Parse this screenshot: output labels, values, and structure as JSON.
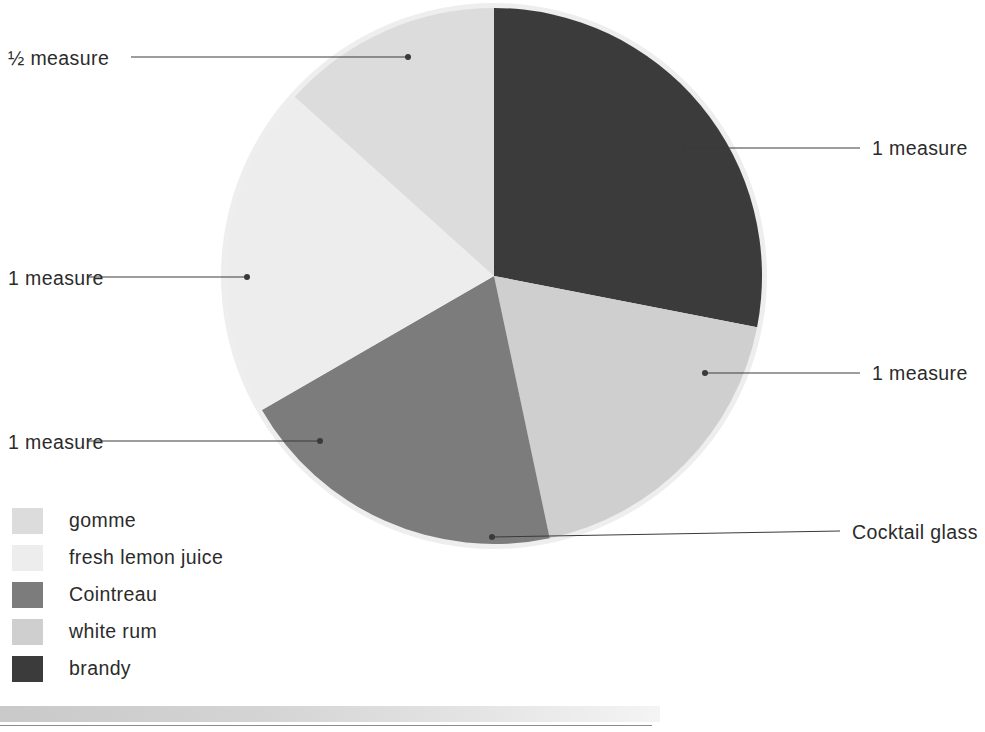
{
  "chart_data": {
    "type": "pie",
    "title": "",
    "units": "measure",
    "total_measures": 4.5,
    "legend_position": "bottom-left",
    "start_angle_deg": 0,
    "direction": "clockwise",
    "center": {
      "x": 494,
      "y": 276
    },
    "radius": 268,
    "categories": [
      "brandy",
      "white rum",
      "Cointreau",
      "fresh lemon juice",
      "gomme"
    ],
    "values": [
      1,
      1,
      1,
      1,
      0.5
    ],
    "value_labels": [
      "1 measure",
      "1 measure",
      "1 measure",
      "1 measure",
      "½ measure"
    ],
    "percentages": [
      28.1,
      18.6,
      20.0,
      20.0,
      13.3
    ],
    "colors": [
      "#3b3b3b",
      "#cfcfcf",
      "#7c7c7c",
      "#ededed",
      "#dcdcdc"
    ],
    "slices": [
      {
        "name": "brandy",
        "label": "1 measure",
        "value": 1,
        "start_deg": 0,
        "end_deg": 101,
        "color": "#3b3b3b"
      },
      {
        "name": "white rum",
        "label": "1 measure",
        "value": 1,
        "start_deg": 101,
        "end_deg": 168,
        "color": "#cfcfcf"
      },
      {
        "name": "Cointreau",
        "label": "1 measure",
        "value": 1,
        "start_deg": 168,
        "end_deg": 240,
        "color": "#7c7c7c"
      },
      {
        "name": "fresh lemon juice",
        "label": "1 measure",
        "value": 1,
        "start_deg": 240,
        "end_deg": 312,
        "color": "#ededed"
      },
      {
        "name": "gomme",
        "label": "½ measure",
        "value": 0.5,
        "start_deg": 312,
        "end_deg": 360,
        "color": "#dcdcdc"
      }
    ]
  },
  "callouts": [
    {
      "id": "gomme",
      "text": "½ measure",
      "text_x": 8,
      "text_y": 47,
      "line_x1": 131,
      "line_y1": 57,
      "line_x2": 408,
      "line_y2": 57,
      "dot_x": 408,
      "dot_y": 57,
      "align": "left"
    },
    {
      "id": "brandy",
      "text": "1 measure",
      "text_x": 872,
      "text_y": 137,
      "line_x1": 684,
      "line_y1": 148,
      "line_x2": 860,
      "line_y2": 148,
      "dot_x": 684,
      "dot_y": 148,
      "align": "left"
    },
    {
      "id": "fresh-lemon-juice",
      "text": "1 measure",
      "text_x": 8,
      "text_y": 267,
      "line_x1": 88,
      "line_y1": 277,
      "line_x2": 247,
      "line_y2": 277,
      "dot_x": 247,
      "dot_y": 277,
      "align": "left"
    },
    {
      "id": "white-rum",
      "text": "1 measure",
      "text_x": 872,
      "text_y": 362,
      "line_x1": 705,
      "line_y1": 373,
      "line_x2": 860,
      "line_y2": 373,
      "dot_x": 705,
      "dot_y": 373,
      "align": "left"
    },
    {
      "id": "cointreau",
      "text": "1 measure",
      "text_x": 8,
      "text_y": 431,
      "line_x1": 88,
      "line_y1": 441,
      "line_x2": 320,
      "line_y2": 441,
      "dot_x": 320,
      "dot_y": 441,
      "align": "left"
    },
    {
      "id": "cocktail-glass",
      "text": "Cocktail glass",
      "text_x": 852,
      "text_y": 521,
      "line_x1": 492,
      "line_y1": 537,
      "line_x2": 840,
      "line_y2": 531,
      "dot_x": 492,
      "dot_y": 537,
      "align": "left"
    }
  ],
  "legend": {
    "items": [
      {
        "label": "gomme",
        "color": "#dcdcdc"
      },
      {
        "label": "fresh lemon juice",
        "color": "#ededed"
      },
      {
        "label": "Cointreau",
        "color": "#7c7c7c"
      },
      {
        "label": "white rum",
        "color": "#cfcfcf"
      },
      {
        "label": "brandy",
        "color": "#3b3b3b"
      }
    ]
  },
  "style": {
    "page_background": "#ffffff",
    "text_color": "#2b2b2b",
    "leader_line_color": "#3a3a3a",
    "pie_halo_color": "#eeeeee"
  }
}
